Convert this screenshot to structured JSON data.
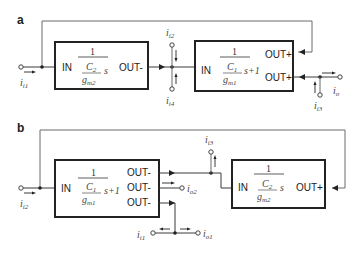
{
  "panels": [
    {
      "label": "a",
      "blocks": [
        {
          "id": "a-block1",
          "in_label": "IN",
          "out_labels": [
            "OUT-"
          ],
          "tf_num": "1",
          "tf_C": "C",
          "tf_C_sub": "2",
          "tf_g": "g",
          "tf_g_sub": "m2",
          "tf_tail": "s"
        },
        {
          "id": "a-block2",
          "in_label": "IN",
          "out_labels": [
            "OUT+",
            "OUT+"
          ],
          "tf_num": "1",
          "tf_C": "C",
          "tf_C_sub": "1",
          "tf_g": "g",
          "tf_g_sub": "m1",
          "tf_tail": "s+1"
        }
      ],
      "currents": [
        {
          "name": "i",
          "sub": "i1"
        },
        {
          "name": "i",
          "sub": "i2"
        },
        {
          "name": "i",
          "sub": "i4"
        },
        {
          "name": "i",
          "sub": "i3"
        },
        {
          "name": "i",
          "sub": "o"
        }
      ]
    },
    {
      "label": "b",
      "blocks": [
        {
          "id": "b-block1",
          "in_label": "IN",
          "out_labels": [
            "OUT-",
            "OUT-",
            "OUT-"
          ],
          "tf_num": "1",
          "tf_C": "C",
          "tf_C_sub": "1",
          "tf_g": "g",
          "tf_g_sub": "m1",
          "tf_tail": "s+1"
        },
        {
          "id": "b-block2",
          "in_label": "IN",
          "out_labels": [
            "OUT+"
          ],
          "tf_num": "1",
          "tf_C": "C",
          "tf_C_sub": "2",
          "tf_g": "g",
          "tf_g_sub": "m2",
          "tf_tail": "s"
        }
      ],
      "currents": [
        {
          "name": "i",
          "sub": "i2"
        },
        {
          "name": "i",
          "sub": "o2"
        },
        {
          "name": "i",
          "sub": "i3"
        },
        {
          "name": "i",
          "sub": "i1"
        },
        {
          "name": "i",
          "sub": "o1"
        }
      ]
    }
  ]
}
